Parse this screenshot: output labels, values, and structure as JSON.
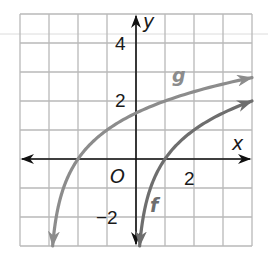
{
  "chart_data": {
    "type": "line",
    "title": "",
    "xlabel": "x",
    "ylabel": "y",
    "origin_label": "O",
    "xlim": [
      -4,
      4
    ],
    "ylim": [
      -3,
      5
    ],
    "grid": true,
    "grid_step": 1,
    "x_tick_labels": [
      {
        "value": 2,
        "label": "2"
      }
    ],
    "y_tick_labels": [
      {
        "value": 4,
        "label": "4"
      },
      {
        "value": 2,
        "label": "2"
      },
      {
        "value": -2,
        "label": "−2"
      }
    ],
    "series": [
      {
        "name": "f",
        "label": "f",
        "color": "#6e6e6e",
        "expression": "log2(x)",
        "x": [
          0.125,
          0.25,
          0.5,
          1,
          2,
          3,
          4
        ],
        "y": [
          -3,
          -2,
          -1,
          0,
          1,
          1.585,
          2
        ]
      },
      {
        "name": "g",
        "label": "g",
        "color": "#8c8c8c",
        "expression": "log2(x + 3)",
        "x": [
          -2.875,
          -2.75,
          -2.5,
          -2,
          -1,
          0,
          1,
          2,
          3,
          4
        ],
        "y": [
          -3,
          -2,
          -1,
          0,
          1,
          1.585,
          2,
          2.322,
          2.585,
          2.807
        ]
      }
    ]
  }
}
